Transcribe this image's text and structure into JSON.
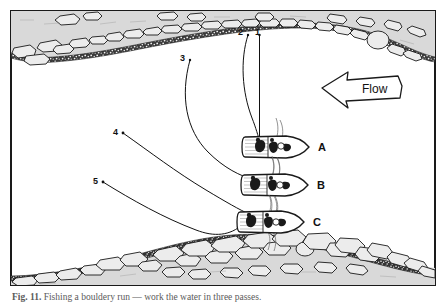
{
  "figure": {
    "frame_color": "#1a1a1a",
    "water_color": "#ffffff",
    "bank_fill": "#d9d9d9",
    "rock_fill": "#e8e8e8",
    "gravel_fill": "#2b2b2b",
    "line_color": "#111111"
  },
  "flow": {
    "label": "Flow",
    "direction": "left",
    "icon": "left-arrow-banner-icon"
  },
  "callouts": [
    {
      "id": "1",
      "label": "1",
      "target": "boat-a"
    },
    {
      "id": "2",
      "label": "2",
      "target": "boat-a"
    },
    {
      "id": "3",
      "label": "3",
      "target": "boat-b"
    },
    {
      "id": "4",
      "label": "4",
      "target": "boat-c"
    },
    {
      "id": "5",
      "label": "5",
      "target": "boat-c"
    }
  ],
  "boats": [
    {
      "id": "boat-a",
      "label": "A"
    },
    {
      "id": "boat-b",
      "label": "B"
    },
    {
      "id": "boat-c",
      "label": "C"
    }
  ],
  "caption": {
    "number": "Fig. 11.",
    "text": "Fishing a bouldery run — work the water in three passes."
  }
}
